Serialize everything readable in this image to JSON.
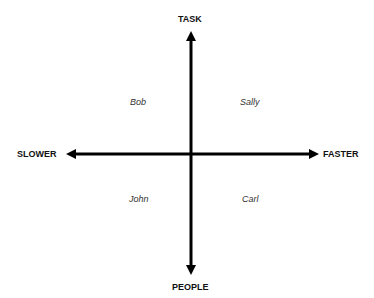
{
  "axes": {
    "top": "TASK",
    "bottom": "PEOPLE",
    "left": "SLOWER",
    "right": "FASTER"
  },
  "quadrants": {
    "top_left": "Bob",
    "top_right": "Sally",
    "bottom_left": "John",
    "bottom_right": "Carl"
  },
  "colors": {
    "axis": "#000000",
    "background": "#ffffff"
  }
}
